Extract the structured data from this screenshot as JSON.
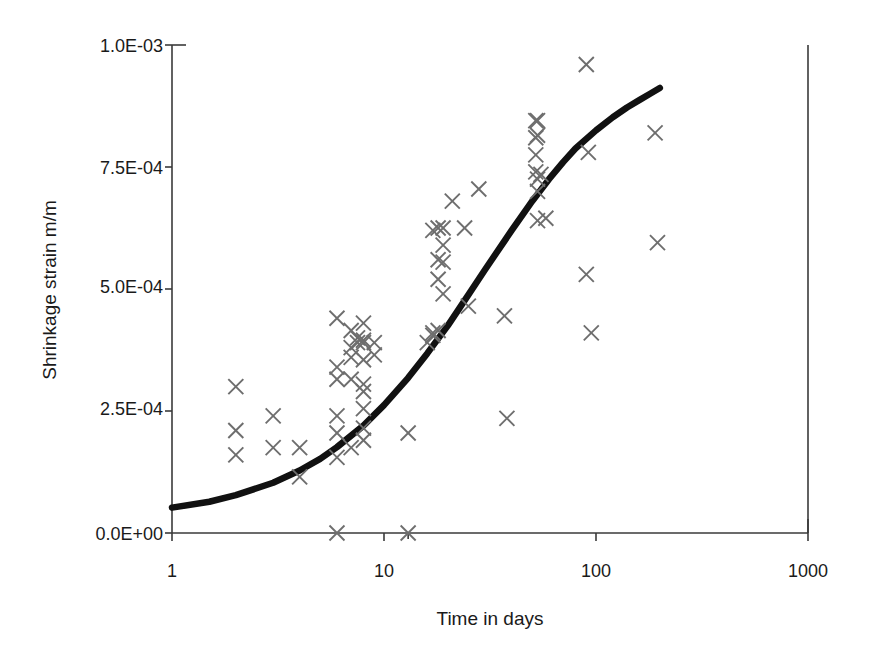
{
  "chart_data": {
    "type": "scatter",
    "title": "",
    "xlabel": "Time in days",
    "ylabel": "Shrinkage strain  m/m",
    "xscale": "log",
    "yscale": "linear",
    "xlim": [
      1,
      1000
    ],
    "ylim": [
      0,
      0.001
    ],
    "grid": false,
    "legend": null,
    "xticks": [
      1,
      10,
      100,
      1000
    ],
    "xticklabels": [
      "1",
      "10",
      "100",
      "1000"
    ],
    "yticks": [
      0,
      0.00025,
      0.0005,
      0.00075,
      0.001
    ],
    "yticklabels": [
      "0.0E+00",
      "2.5E-04",
      "5.0E-04",
      "7.5E-04",
      "1.0E-03"
    ],
    "series": [
      {
        "name": "Measured shrinkage data",
        "type": "scatter",
        "marker": "x",
        "color": "#6e6e6e",
        "points": [
          [
            2,
            0.0003
          ],
          [
            2,
            0.00021
          ],
          [
            2,
            0.00016
          ],
          [
            3,
            0.00024
          ],
          [
            3,
            0.000175
          ],
          [
            4,
            0.000175
          ],
          [
            4,
            0.000115
          ],
          [
            6,
            0.00044
          ],
          [
            6,
            0.00034
          ],
          [
            6,
            0.000315
          ],
          [
            6,
            0.00024
          ],
          [
            6,
            0.000205
          ],
          [
            6,
            0.000155
          ],
          [
            6,
            0.0
          ],
          [
            7,
            0.000415
          ],
          [
            7,
            0.00038
          ],
          [
            7,
            0.00036
          ],
          [
            7,
            0.000315
          ],
          [
            7,
            0.000175
          ],
          [
            7.5,
            0.0004
          ],
          [
            7.5,
            0.00039
          ],
          [
            8,
            0.00043
          ],
          [
            8,
            0.000395
          ],
          [
            8,
            0.00039
          ],
          [
            8,
            0.000355
          ],
          [
            8,
            0.000305
          ],
          [
            8,
            0.00029
          ],
          [
            8,
            0.000255
          ],
          [
            8,
            0.000215
          ],
          [
            8,
            0.00019
          ],
          [
            9,
            0.00039
          ],
          [
            9,
            0.000365
          ],
          [
            13,
            0.000205
          ],
          [
            13,
            0.0
          ],
          [
            16,
            0.00039
          ],
          [
            17,
            0.00062
          ],
          [
            17,
            0.00041
          ],
          [
            17,
            0.000405
          ],
          [
            18,
            0.000625
          ],
          [
            18,
            0.00056
          ],
          [
            18,
            0.00052
          ],
          [
            18,
            0.000415
          ],
          [
            19,
            0.000625
          ],
          [
            19,
            0.00059
          ],
          [
            19,
            0.000555
          ],
          [
            19,
            0.00049
          ],
          [
            21,
            0.00068
          ],
          [
            24,
            0.000625
          ],
          [
            25,
            0.000465
          ],
          [
            28,
            0.000705
          ],
          [
            37,
            0.000445
          ],
          [
            38,
            0.000235
          ],
          [
            52,
            0.000845
          ],
          [
            52,
            0.00081
          ],
          [
            52,
            0.000775
          ],
          [
            52,
            0.00074
          ],
          [
            53,
            0.000845
          ],
          [
            53,
            0.000815
          ],
          [
            53,
            0.000725
          ],
          [
            53,
            0.0007
          ],
          [
            53,
            0.00064
          ],
          [
            55,
            0.000735
          ],
          [
            58,
            0.000645
          ],
          [
            90,
            0.00096
          ],
          [
            90,
            0.00053
          ],
          [
            92,
            0.00078
          ],
          [
            95,
            0.00041
          ],
          [
            190,
            0.00082
          ],
          [
            195,
            0.000595
          ]
        ]
      },
      {
        "name": "Predicted shrinkage model curve",
        "type": "line",
        "color": "#111111",
        "points": [
          [
            1,
            5.2e-05
          ],
          [
            1.5,
            6.4e-05
          ],
          [
            2,
            7.75e-05
          ],
          [
            3,
            0.000103
          ],
          [
            4,
            0.000128
          ],
          [
            5,
            0.000152
          ],
          [
            6,
            0.000176
          ],
          [
            8,
            0.00022
          ],
          [
            10,
            0.000262
          ],
          [
            13,
            0.000318
          ],
          [
            16,
            0.000368
          ],
          [
            20,
            0.000425
          ],
          [
            25,
            0.000488
          ],
          [
            30,
            0.00054
          ],
          [
            40,
            0.00062
          ],
          [
            50,
            0.00068
          ],
          [
            60,
            0.000725
          ],
          [
            70,
            0.00076
          ],
          [
            80,
            0.000788
          ],
          [
            100,
            0.000825
          ],
          [
            120,
            0.000852
          ],
          [
            140,
            0.000872
          ],
          [
            160,
            0.000887
          ],
          [
            180,
            0.0009
          ],
          [
            200,
            0.000912
          ]
        ]
      }
    ]
  },
  "footer": {
    "artifact_text": ""
  }
}
